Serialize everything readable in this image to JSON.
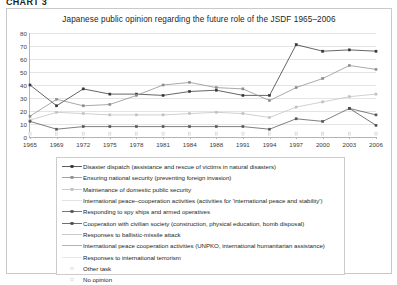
{
  "caption": "CHART 3",
  "chart_data": {
    "type": "line",
    "title": "Japanese public opinion regarding the future role of the JSDF 1965–2006",
    "xlabel": "",
    "ylabel": "",
    "ylim": [
      0,
      80
    ],
    "ytick_step": 10,
    "yticks": [
      0,
      10,
      20,
      30,
      40,
      50,
      60,
      70,
      80
    ],
    "grid": true,
    "legend_position": "below",
    "categories": [
      "1965",
      "1969",
      "1972",
      "1975",
      "1978",
      "1981",
      "1984",
      "1988",
      "1991",
      "1994",
      "1997",
      "2000",
      "2003",
      "2006"
    ],
    "series": [
      {
        "name": "Disaster dispatch (assistance and rescue of victims in natural disasters)",
        "marker": "square-filled",
        "line": "solid",
        "color": "#333333",
        "values": [
          40,
          24,
          37,
          33,
          33,
          32,
          35,
          36,
          32,
          32,
          71,
          66,
          67,
          66
        ]
      },
      {
        "name": "Ensuring national security (preventing foreign invasion)",
        "marker": "square-filled",
        "line": "solid",
        "color": "#8c8c8c",
        "values": [
          16,
          29,
          24,
          25,
          32,
          40,
          42,
          38,
          37,
          28,
          38,
          45,
          55,
          52
        ]
      },
      {
        "name": "Maintenance of domestic public security",
        "marker": "square-filled",
        "line": "solid",
        "color": "#c0c0c0",
        "values": [
          13,
          19,
          18,
          17,
          17,
          17,
          18,
          19,
          18,
          15,
          23,
          27,
          31,
          33
        ]
      },
      {
        "name": "International peace–cooperation activities (activities for 'international peace and stability')",
        "marker": "none",
        "line": "solid",
        "color": "#dcdcdc",
        "values": [
          null,
          null,
          null,
          null,
          null,
          null,
          null,
          null,
          null,
          null,
          null,
          null,
          null,
          null
        ]
      },
      {
        "name": "Responding to spy ships and armed operatives",
        "marker": "square-filled",
        "line": "solid",
        "color": "#555555",
        "values": [
          12,
          6,
          8,
          8,
          8,
          8,
          8,
          8,
          8,
          6,
          14,
          12,
          22,
          17
        ]
      },
      {
        "name": "Cooperation with civilian society (construction, physical education, bomb disposal)",
        "marker": "square-filled",
        "line": "solid",
        "color": "#4a4a4a",
        "values": [
          null,
          null,
          null,
          null,
          null,
          null,
          null,
          null,
          null,
          null,
          null,
          null,
          22,
          9
        ]
      },
      {
        "name": "Responses to ballistic-missile attack",
        "marker": "none",
        "line": "solid",
        "color": "#bdbdbd",
        "values": [
          null,
          null,
          null,
          null,
          null,
          null,
          null,
          null,
          null,
          null,
          null,
          null,
          null,
          null
        ]
      },
      {
        "name": "International peace cooperation activities (UNPKO, international humanitarian assistance)",
        "marker": "none",
        "line": "solid",
        "color": "#9e9e9e",
        "values": [
          null,
          null,
          null,
          null,
          null,
          null,
          null,
          null,
          null,
          null,
          null,
          null,
          null,
          null
        ]
      },
      {
        "name": "Responses to international terrorism",
        "marker": "none",
        "line": "solid",
        "color": "#e2e2e2",
        "values": [
          null,
          null,
          null,
          null,
          null,
          null,
          null,
          null,
          null,
          null,
          null,
          null,
          null,
          null
        ]
      },
      {
        "name": "Other task",
        "marker": "square-open",
        "line": "none",
        "color": "#d2d2d2",
        "values": [
          3,
          3,
          3,
          3,
          3,
          3,
          3,
          3,
          3,
          3,
          3,
          3,
          3,
          3
        ]
      },
      {
        "name": "No opinion",
        "marker": "square-open",
        "line": "none",
        "color": "#cfcfcf",
        "values": [
          2,
          2,
          2,
          2,
          2,
          2,
          2,
          2,
          2,
          2,
          2,
          2,
          2,
          2
        ]
      }
    ]
  }
}
